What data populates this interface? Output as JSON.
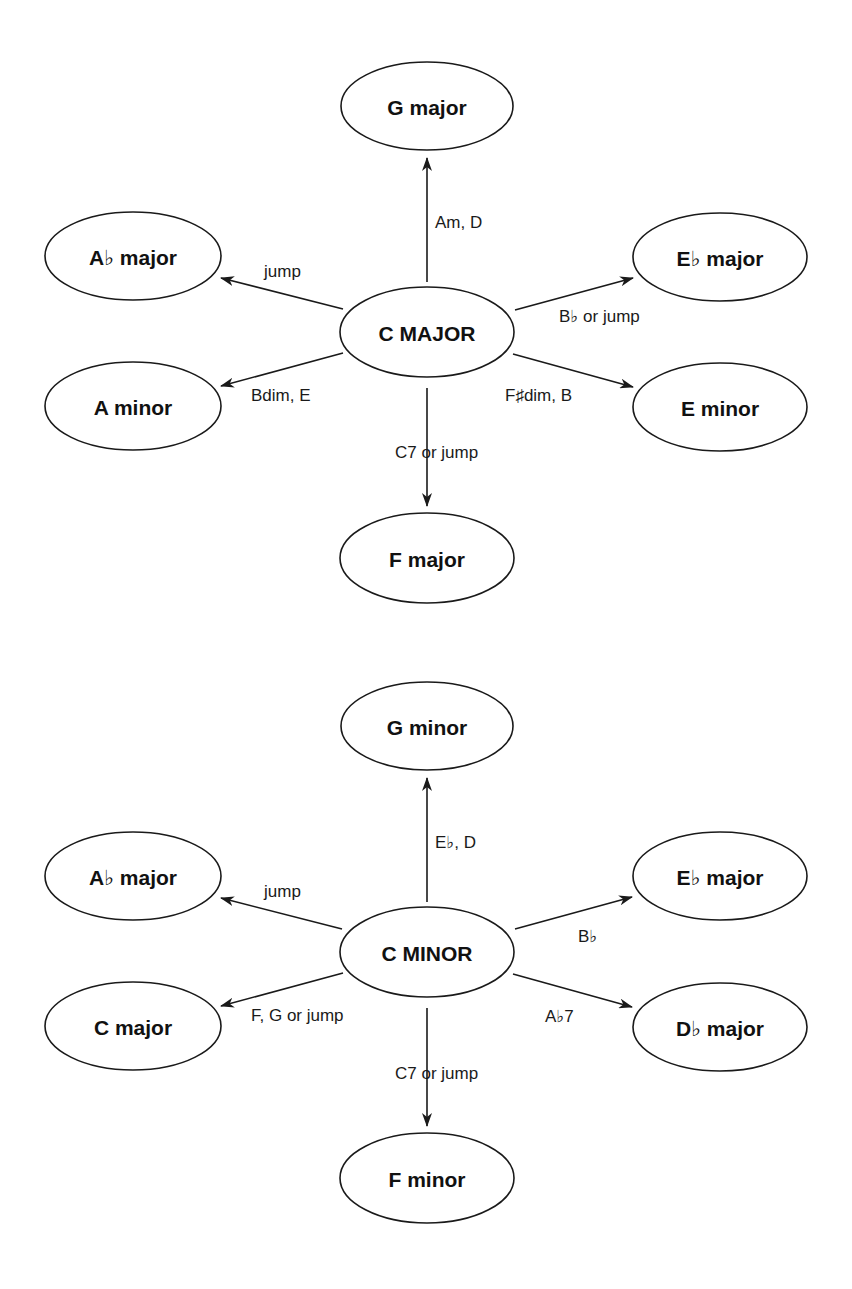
{
  "colors": {
    "stroke": "#1a1a1a",
    "text": "#111111",
    "background": "#ffffff"
  },
  "diagrams": [
    {
      "name": "c-major-modulations",
      "center": {
        "label": "C MAJOR",
        "cx": 427,
        "cy": 332,
        "rx": 87,
        "ry": 45
      },
      "nodes": [
        {
          "id": "g-major",
          "label": "G major",
          "cx": 427,
          "cy": 106,
          "rx": 86,
          "ry": 44
        },
        {
          "id": "a-flat-major",
          "label": "A♭ major",
          "cx": 133,
          "cy": 256,
          "rx": 88,
          "ry": 44
        },
        {
          "id": "e-flat-major",
          "label": "E♭ major",
          "cx": 720,
          "cy": 257,
          "rx": 87,
          "ry": 44
        },
        {
          "id": "a-minor",
          "label": "A minor",
          "cx": 133,
          "cy": 406,
          "rx": 88,
          "ry": 44
        },
        {
          "id": "e-minor",
          "label": "E minor",
          "cx": 720,
          "cy": 407,
          "rx": 87,
          "ry": 44
        },
        {
          "id": "f-major",
          "label": "F major",
          "cx": 427,
          "cy": 558,
          "rx": 87,
          "ry": 45
        }
      ],
      "edges": [
        {
          "to": "g-major",
          "label": "Am, D",
          "x1": 427,
          "y1": 282,
          "x2": 427,
          "y2": 158,
          "lx": 435,
          "ly": 228,
          "anchor": "start"
        },
        {
          "to": "a-flat-major",
          "label": "jump",
          "x1": 343,
          "y1": 309,
          "x2": 221,
          "y2": 278,
          "lx": 264,
          "ly": 277,
          "anchor": "start"
        },
        {
          "to": "e-flat-major",
          "label": "B♭ or jump",
          "x1": 515,
          "y1": 310,
          "x2": 633,
          "y2": 278,
          "lx": 559,
          "ly": 322,
          "anchor": "start"
        },
        {
          "to": "a-minor",
          "label": "Bdim, E",
          "x1": 343,
          "y1": 353,
          "x2": 221,
          "y2": 386,
          "lx": 251,
          "ly": 401,
          "anchor": "start"
        },
        {
          "to": "e-minor",
          "label": "F♯dim, B",
          "x1": 513,
          "y1": 354,
          "x2": 633,
          "y2": 387,
          "lx": 505,
          "ly": 401,
          "anchor": "start"
        },
        {
          "to": "f-major",
          "label": "C7 or jump",
          "x1": 427,
          "y1": 388,
          "x2": 427,
          "y2": 506,
          "lx": 395,
          "ly": 458,
          "anchor": "start"
        }
      ]
    },
    {
      "name": "c-minor-modulations",
      "center": {
        "label": "C MINOR",
        "cx": 427,
        "cy": 952,
        "rx": 87,
        "ry": 45
      },
      "nodes": [
        {
          "id": "g-minor",
          "label": "G minor",
          "cx": 427,
          "cy": 726,
          "rx": 86,
          "ry": 44
        },
        {
          "id": "a-flat-major",
          "label": "A♭ major",
          "cx": 133,
          "cy": 876,
          "rx": 88,
          "ry": 44
        },
        {
          "id": "e-flat-major",
          "label": "E♭ major",
          "cx": 720,
          "cy": 876,
          "rx": 87,
          "ry": 44
        },
        {
          "id": "c-major",
          "label": "C major",
          "cx": 133,
          "cy": 1026,
          "rx": 88,
          "ry": 44
        },
        {
          "id": "d-flat-major",
          "label": "D♭ major",
          "cx": 720,
          "cy": 1027,
          "rx": 87,
          "ry": 44
        },
        {
          "id": "f-minor",
          "label": "F minor",
          "cx": 427,
          "cy": 1178,
          "rx": 87,
          "ry": 45
        }
      ],
      "edges": [
        {
          "to": "g-minor",
          "label": "E♭, D",
          "x1": 427,
          "y1": 902,
          "x2": 427,
          "y2": 778,
          "lx": 435,
          "ly": 848,
          "anchor": "start"
        },
        {
          "to": "a-flat-major",
          "label": "jump",
          "x1": 342,
          "y1": 929,
          "x2": 221,
          "y2": 898,
          "lx": 264,
          "ly": 897,
          "anchor": "start"
        },
        {
          "to": "e-flat-major",
          "label": "B♭",
          "x1": 515,
          "y1": 929,
          "x2": 632,
          "y2": 897,
          "lx": 578,
          "ly": 942,
          "anchor": "start"
        },
        {
          "to": "c-major",
          "label": "F, G or jump",
          "x1": 343,
          "y1": 973,
          "x2": 221,
          "y2": 1006,
          "lx": 251,
          "ly": 1021,
          "anchor": "start"
        },
        {
          "to": "d-flat-major",
          "label": "A♭7",
          "x1": 513,
          "y1": 974,
          "x2": 632,
          "y2": 1007,
          "lx": 545,
          "ly": 1022,
          "anchor": "start"
        },
        {
          "to": "f-minor",
          "label": "C7 or jump",
          "x1": 427,
          "y1": 1008,
          "x2": 427,
          "y2": 1126,
          "lx": 395,
          "ly": 1079,
          "anchor": "start"
        }
      ]
    }
  ]
}
